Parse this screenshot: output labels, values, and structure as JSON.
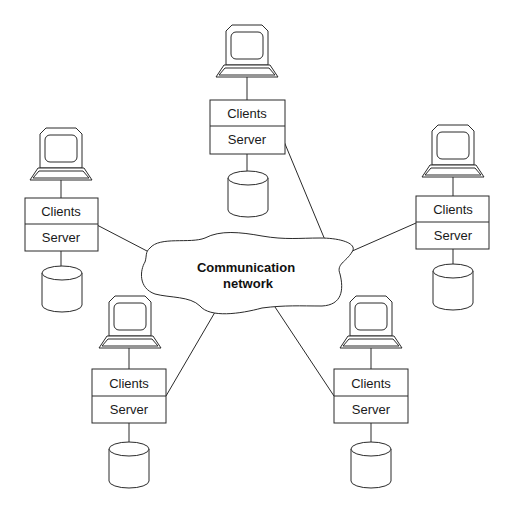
{
  "diagram": {
    "type": "client-server network",
    "network": {
      "label_line1": "Communication",
      "label_line2": "network"
    },
    "nodes": [
      {
        "id": "top",
        "clients_label": "Clients",
        "server_label": "Server"
      },
      {
        "id": "left",
        "clients_label": "Clients",
        "server_label": "Server"
      },
      {
        "id": "right",
        "clients_label": "Clients",
        "server_label": "Server"
      },
      {
        "id": "bottom-left",
        "clients_label": "Clients",
        "server_label": "Server"
      },
      {
        "id": "bottom-right",
        "clients_label": "Clients",
        "server_label": "Server"
      }
    ],
    "icons": {
      "terminal": "computer-terminal-icon",
      "storage": "database-cylinder-icon"
    },
    "colors": {
      "line": "#2a2a2a",
      "background": "#ffffff",
      "text": "#1a1a1a"
    }
  }
}
